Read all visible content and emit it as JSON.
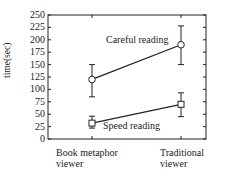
{
  "chart_data": {
    "type": "line",
    "title": "",
    "xlabel": "",
    "ylabel": "time(sec)",
    "categories": [
      "Book metaphor viewer",
      "Traditional viewer"
    ],
    "category_lines": [
      [
        "Book metaphor",
        "viewer"
      ],
      [
        "Traditional",
        "viewer"
      ]
    ],
    "ylim": [
      0,
      250
    ],
    "yticks": [
      0,
      25,
      50,
      75,
      100,
      125,
      150,
      175,
      200,
      225,
      250
    ],
    "grid": false,
    "legend_position": "inline annotations",
    "series": [
      {
        "name": "Careful reading",
        "marker": "circle",
        "values": [
          120,
          190
        ],
        "err_low": [
          85,
          150
        ],
        "err_high": [
          150,
          228
        ]
      },
      {
        "name": "Speed reading",
        "marker": "square",
        "values": [
          32,
          70
        ],
        "err_low": [
          22,
          45
        ],
        "err_high": [
          46,
          93
        ]
      }
    ],
    "annotations": [
      "Careful reading",
      "Speed reading"
    ],
    "colors": {
      "line": "#222222",
      "axis": "#222222",
      "background": "#ffffff"
    }
  }
}
